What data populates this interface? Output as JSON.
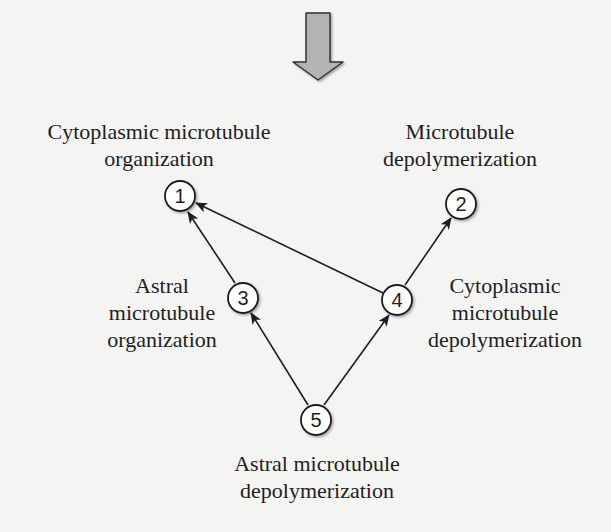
{
  "diagram": {
    "top_arrow": {
      "direction": "down",
      "fill": "#b3b3b3",
      "stroke": "#333333"
    },
    "nodes": [
      {
        "id": "1",
        "label": "1",
        "cx": 180,
        "cy": 196
      },
      {
        "id": "2",
        "label": "2",
        "cx": 461,
        "cy": 204
      },
      {
        "id": "3",
        "label": "3",
        "cx": 243,
        "cy": 298
      },
      {
        "id": "4",
        "label": "4",
        "cx": 397,
        "cy": 300
      },
      {
        "id": "5",
        "label": "5",
        "cx": 316,
        "cy": 420
      }
    ],
    "edges": [
      {
        "from": "4",
        "to": "1"
      },
      {
        "from": "3",
        "to": "1"
      },
      {
        "from": "4",
        "to": "2"
      },
      {
        "from": "5",
        "to": "3"
      },
      {
        "from": "5",
        "to": "4"
      }
    ],
    "labels": {
      "node1": {
        "line1": "Cytoplasmic microtubule",
        "line2": "organization"
      },
      "node2": {
        "line1": "Microtubule",
        "line2": "depolymerization"
      },
      "node3": {
        "line1": "Astral",
        "line2": "microtubule",
        "line3": "organization"
      },
      "node4": {
        "line1": "Cytoplasmic",
        "line2": "microtubule",
        "line3": "depolymerization"
      },
      "node5": {
        "line1": "Astral microtubule",
        "line2": "depolymerization"
      }
    }
  }
}
